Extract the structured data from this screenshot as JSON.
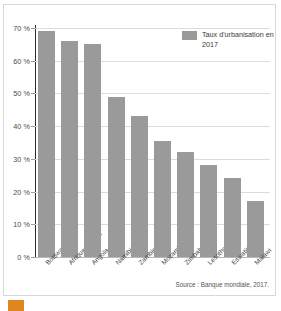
{
  "figure": {
    "source_note": "Source : Banque mondiale, 2017.",
    "legend_label": "Taux d'urbanisation en 2017",
    "bar_color": "#9a9a9a",
    "grid_color": "#dcdcd8",
    "axis_color": "#2b2b29"
  },
  "caption": {
    "marker": "",
    "text": ""
  },
  "chart_data": {
    "type": "bar",
    "title": "",
    "subtitle": "",
    "xlabel": "",
    "ylabel": "",
    "ylim": [
      0,
      70
    ],
    "ytick_step": 10,
    "grid": true,
    "legend_position": "top-right",
    "legend": [
      "Taux d'urbanisation en 2017"
    ],
    "unit": "%",
    "ytick_labels": [
      "0 %",
      "10 %",
      "20 %",
      "30 %",
      "40 %",
      "50 %",
      "60 %",
      "70 %"
    ],
    "ytick_values": [
      0,
      10,
      20,
      30,
      40,
      50,
      60,
      70
    ],
    "categories": [
      "Botswana",
      "Afrique du Sud",
      "Angola",
      "Namibie",
      "Zambie",
      "Mozambique",
      "Zimbabwe",
      "Lesotho",
      "Eswatini",
      "Malawi"
    ],
    "values": [
      69,
      66,
      65,
      49,
      43,
      35.5,
      32,
      28,
      24,
      17
    ],
    "annotations": [
      "Source : Banque mondiale, 2017."
    ]
  }
}
